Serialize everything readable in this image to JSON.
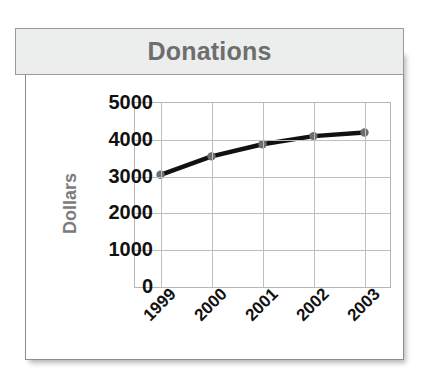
{
  "chart_title": "Donations",
  "axes": {
    "y_label": "Dollars",
    "y_ticks": [
      "5000",
      "4000",
      "3000",
      "2000",
      "1000",
      "0"
    ],
    "x_ticks": [
      "1999",
      "2000",
      "2001",
      "2002",
      "2003"
    ]
  },
  "colors": {
    "title_text": "#6e6e6e",
    "title_banner": "#eceded",
    "line": "#111111",
    "marker": "#6e6e6e",
    "grid": "#bfbfbf",
    "frame_border": "#8d8d8d"
  },
  "chart_data": {
    "type": "line",
    "title": "Donations",
    "xlabel": "",
    "ylabel": "Dollars",
    "categories": [
      "1999",
      "2000",
      "2001",
      "2002",
      "2003"
    ],
    "values": [
      3050,
      3550,
      3880,
      4100,
      4200
    ],
    "ylim": [
      0,
      5000
    ],
    "ytick_values": [
      0,
      1000,
      2000,
      3000,
      4000,
      5000
    ],
    "grid": true,
    "legend": false,
    "marker": "circle",
    "series": [
      {
        "name": "Donations",
        "values": [
          3050,
          3550,
          3880,
          4100,
          4200
        ]
      }
    ]
  }
}
